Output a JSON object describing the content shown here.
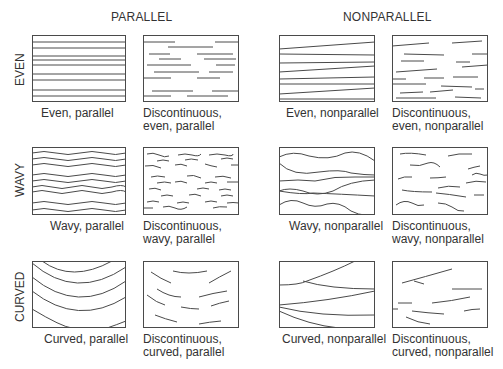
{
  "column_headers": [
    "PARALLEL",
    "NONPARALLEL"
  ],
  "row_headers": [
    "EVEN",
    "WAVY",
    "CURVED"
  ],
  "panels": [
    {
      "caption": "Even, parallel"
    },
    {
      "caption": "Discontinuous, even, parallel"
    },
    {
      "caption": "Even, nonparallel"
    },
    {
      "caption": "Discontinuous, even, nonparallel"
    },
    {
      "caption": "Wavy, parallel"
    },
    {
      "caption": "Discontinuous, wavy, parallel"
    },
    {
      "caption": "Wavy, nonparallel"
    },
    {
      "caption": "Discontinuous, wavy, nonparallel"
    },
    {
      "caption": "Curved, parallel"
    },
    {
      "caption": "Discontinuous, curved, parallel"
    },
    {
      "caption": "Curved, nonparallel"
    },
    {
      "caption": "Discontinuous, curved, nonparallel"
    }
  ],
  "colors": {
    "line": "#4a4a4a",
    "text": "#333333",
    "background": "#ffffff"
  }
}
